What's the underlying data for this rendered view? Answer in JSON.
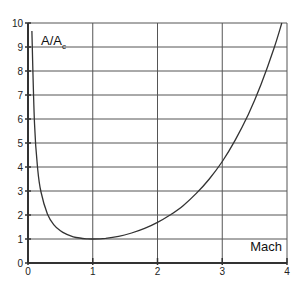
{
  "chart_data": {
    "type": "line",
    "title": "",
    "xlabel": "Mach",
    "ylabel": "A/A",
    "ylabel_subscript": "c",
    "xlim": [
      0,
      4
    ],
    "ylim": [
      0,
      10
    ],
    "grid": true,
    "legend": null,
    "x_ticks": [
      "0",
      "1",
      "2",
      "3",
      "4"
    ],
    "y_ticks": [
      "0",
      "1",
      "2",
      "3",
      "4",
      "5",
      "6",
      "7",
      "8",
      "9",
      "10"
    ],
    "series": [
      {
        "name": "A/Ac vs Mach",
        "color": "#333333",
        "x": [
          0.06,
          0.1,
          0.15,
          0.2,
          0.3,
          0.4,
          0.5,
          0.6,
          0.7,
          0.8,
          0.9,
          1.0,
          1.2,
          1.4,
          1.6,
          1.8,
          2.0,
          2.2,
          2.4,
          2.6,
          2.8,
          3.0,
          3.2,
          3.4,
          3.6,
          3.8,
          3.92
        ],
        "y": [
          9.67,
          5.82,
          3.91,
          2.96,
          2.04,
          1.59,
          1.34,
          1.19,
          1.09,
          1.04,
          1.01,
          1.0,
          1.03,
          1.11,
          1.25,
          1.44,
          1.69,
          2.01,
          2.4,
          2.9,
          3.5,
          4.23,
          5.12,
          6.18,
          7.45,
          8.95,
          10.0
        ]
      }
    ]
  },
  "plot": {
    "left": 28,
    "top": 23,
    "right": 287,
    "bottom": 263,
    "axis_color": "#333333",
    "grid_color": "#555555"
  }
}
